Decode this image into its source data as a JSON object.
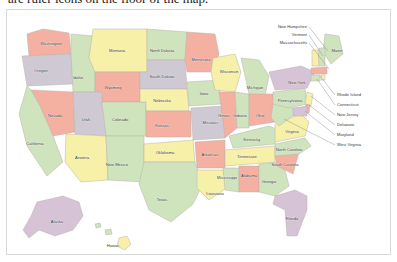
{
  "caption": {
    "text": "are ruler icons on the floor of the map."
  },
  "map": {
    "title": "United States political map",
    "background_color": "#ffffff",
    "frame_color": "#d8d8d6",
    "border_color": "#b9b3ad",
    "label_color": "#3a3a3a",
    "leader_color": "#8a8a8a",
    "palette": {
      "salmon": "#f4b0a0",
      "yellow": "#f7f0a8",
      "green": "#cfe3bd",
      "mauve": "#d6c3d6",
      "pale_gray": "#cfc9d4",
      "cream": "#f7f4d8"
    },
    "states": [
      {
        "name": "Washington",
        "color": "#f4b0a0",
        "label_x": 44,
        "label_y": 34
      },
      {
        "name": "Oregon",
        "color": "#cfc9d4",
        "label_x": 34,
        "label_y": 61
      },
      {
        "name": "Idaho",
        "color": "#cfe3bd",
        "label_x": 71,
        "label_y": 68
      },
      {
        "name": "Montana",
        "color": "#f7f0a8",
        "label_x": 110,
        "label_y": 41
      },
      {
        "name": "Wyoming",
        "color": "#f4b0a0",
        "label_x": 106,
        "label_y": 78
      },
      {
        "name": "Nevada",
        "color": "#f4b0a0",
        "label_x": 48,
        "label_y": 106
      },
      {
        "name": "Utah",
        "color": "#cfc9d4",
        "label_x": 79,
        "label_y": 110
      },
      {
        "name": "California",
        "color": "#cfe3bd",
        "label_x": 28,
        "label_y": 134
      },
      {
        "name": "Arizona",
        "color": "#f7f0a8",
        "label_x": 75,
        "label_y": 148
      },
      {
        "name": "Colorado",
        "color": "#cfe3bd",
        "label_x": 113,
        "label_y": 110
      },
      {
        "name": "New Mexico",
        "color": "#cfe3bd",
        "label_x": 110,
        "label_y": 155
      },
      {
        "name": "North Dakota",
        "color": "#cfe3bd",
        "label_x": 155,
        "label_y": 41
      },
      {
        "name": "South Dakota",
        "color": "#cfc9d4",
        "label_x": 155,
        "label_y": 67
      },
      {
        "name": "Nebraska",
        "color": "#f7f0a8",
        "label_x": 155,
        "label_y": 91
      },
      {
        "name": "Kansas",
        "color": "#f4b0a0",
        "label_x": 155,
        "label_y": 116
      },
      {
        "name": "Oklahoma",
        "color": "#f7f0a8",
        "label_x": 158,
        "label_y": 143
      },
      {
        "name": "Texas",
        "color": "#cfe3bd",
        "label_x": 155,
        "label_y": 190
      },
      {
        "name": "Minnesota",
        "color": "#f4b0a0",
        "label_x": 194,
        "label_y": 50
      },
      {
        "name": "Iowa",
        "color": "#cfe3bd",
        "label_x": 197,
        "label_y": 84
      },
      {
        "name": "Missouri",
        "color": "#cfc9d4",
        "label_x": 203,
        "label_y": 113
      },
      {
        "name": "Arkansas",
        "color": "#f4b0a0",
        "label_x": 203,
        "label_y": 145
      },
      {
        "name": "Louisiana",
        "color": "#f7f0a8",
        "label_x": 208,
        "label_y": 184
      },
      {
        "name": "Wisconsin",
        "color": "#f7f0a8",
        "label_x": 222,
        "label_y": 62
      },
      {
        "name": "Illinois",
        "color": "#f4b0a0",
        "label_x": 217,
        "label_y": 106
      },
      {
        "name": "Indiana",
        "color": "#cfe3bd",
        "label_x": 233,
        "label_y": 106
      },
      {
        "name": "Michigan",
        "color": "#cfe3bd",
        "label_x": 248,
        "label_y": 78
      },
      {
        "name": "Ohio",
        "color": "#f4b0a0",
        "label_x": 253,
        "label_y": 106
      },
      {
        "name": "Kentucky",
        "color": "#cfe3bd",
        "label_x": 245,
        "label_y": 130
      },
      {
        "name": "Tennessee",
        "color": "#f7f0a8",
        "label_x": 240,
        "label_y": 147
      },
      {
        "name": "Mississippi",
        "color": "#cfe3bd",
        "label_x": 220,
        "label_y": 168
      },
      {
        "name": "Alabama",
        "color": "#f4b0a0",
        "label_x": 242,
        "label_y": 166
      },
      {
        "name": "Georgia",
        "color": "#cfe3bd",
        "label_x": 262,
        "label_y": 172
      },
      {
        "name": "Florida",
        "color": "#d6c3d6",
        "label_x": 285,
        "label_y": 209
      },
      {
        "name": "South Carolina",
        "color": "#f4b0a0",
        "label_x": 278,
        "label_y": 155
      },
      {
        "name": "North Carolina",
        "color": "#cfe3bd",
        "label_x": 282,
        "label_y": 140
      },
      {
        "name": "Virginia",
        "color": "#f7f0a8",
        "label_x": 285,
        "label_y": 122
      },
      {
        "name": "Pennsylvania",
        "color": "#cfe3bd",
        "label_x": 283,
        "label_y": 91
      },
      {
        "name": "New York",
        "color": "#d6c3d6",
        "label_x": 290,
        "label_y": 73
      },
      {
        "name": "Maine",
        "color": "#cfe3bd",
        "label_x": 330,
        "label_y": 41
      },
      {
        "name": "Alaska",
        "color": "#d6c3d6",
        "label_x": 50,
        "label_y": 212
      },
      {
        "name": "Hawaii",
        "color": "#f7f0a8",
        "label_x": 106,
        "label_y": 236
      }
    ],
    "callouts_left": [
      {
        "name": "New Hampshire",
        "text_x": 300,
        "text_y": 17,
        "to_x": 321,
        "to_y": 41
      },
      {
        "name": "Vermont",
        "text_x": 300,
        "text_y": 25,
        "to_x": 316,
        "to_y": 46
      },
      {
        "name": "Massachusetts",
        "text_x": 300,
        "text_y": 33,
        "to_x": 322,
        "to_y": 59
      }
    ],
    "callouts_right": [
      {
        "name": "Rhode Island",
        "text_x": 330,
        "text_y": 85,
        "to_x": 313,
        "to_y": 66
      },
      {
        "name": "Connecticut",
        "text_x": 330,
        "text_y": 95,
        "to_x": 310,
        "to_y": 69
      },
      {
        "name": "New Jersey",
        "text_x": 330,
        "text_y": 105,
        "to_x": 304,
        "to_y": 86
      },
      {
        "name": "Delaware",
        "text_x": 330,
        "text_y": 115,
        "to_x": 302,
        "to_y": 95
      },
      {
        "name": "Maryland",
        "text_x": 330,
        "text_y": 125,
        "to_x": 298,
        "to_y": 101
      },
      {
        "name": "West Virginia",
        "text_x": 330,
        "text_y": 135,
        "to_x": 277,
        "to_y": 109
      }
    ]
  }
}
